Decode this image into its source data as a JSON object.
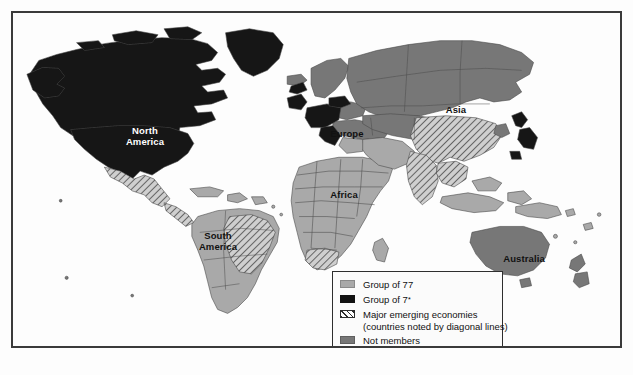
{
  "map": {
    "title": "World map of Group of 77, Group of 7, major emerging economies and non-members",
    "ocean_color": "#fdfdfd",
    "colors": {
      "group_of_77": "#a9a9a9",
      "group_of_7": "#121212",
      "not_members": "#777777",
      "emerging_hatch_line": "#2e2e2e",
      "border_line": "#3a3a3a",
      "country_outline": "#4a4a4a"
    },
    "region_labels": [
      {
        "name": "north-america",
        "text": "North\nAmerica",
        "style": "light",
        "left": 101,
        "top": 113
      },
      {
        "name": "south-america",
        "text": "South\nAmerica",
        "style": "dark",
        "left": 174,
        "top": 218
      },
      {
        "name": "europe",
        "text": "Europe",
        "style": "dark",
        "left": 311,
        "top": 116
      },
      {
        "name": "africa",
        "text": "Africa",
        "style": "dark",
        "left": 311,
        "top": 177
      },
      {
        "name": "asia",
        "text": "Asia",
        "style": "dark",
        "left": 428,
        "top": 92
      },
      {
        "name": "australia",
        "text": "Australia",
        "style": "dark",
        "left": 483,
        "top": 241
      }
    ]
  },
  "legend": {
    "items": [
      {
        "name": "group-of-77",
        "label": "Group of 77",
        "swatch": "sw-g77",
        "note": ""
      },
      {
        "name": "group-of-7",
        "label": "Group of 7",
        "swatch": "sw-g7",
        "note": "*"
      },
      {
        "name": "major-emerging-economies",
        "label": "Major emerging economies",
        "swatch": "sw-emerging",
        "note": ""
      },
      {
        "name": "not-members",
        "label": "Not members",
        "swatch": "sw-none",
        "note": ""
      }
    ],
    "sub_note": "(countries noted by diagonal lines)"
  }
}
